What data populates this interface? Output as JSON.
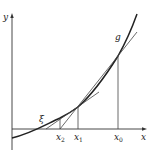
{
  "diagram": {
    "axes": {
      "x_label": "x",
      "y_label": "y"
    },
    "curve_label": "g",
    "root_label": "ξ",
    "ticks": [
      {
        "label": "x",
        "sub": "2",
        "x": 60
      },
      {
        "label": "x",
        "sub": "1",
        "x": 78
      },
      {
        "label": "x",
        "sub": "0",
        "x": 118
      }
    ],
    "colors": {
      "stroke": "#222222",
      "background": "#ffffff"
    }
  }
}
